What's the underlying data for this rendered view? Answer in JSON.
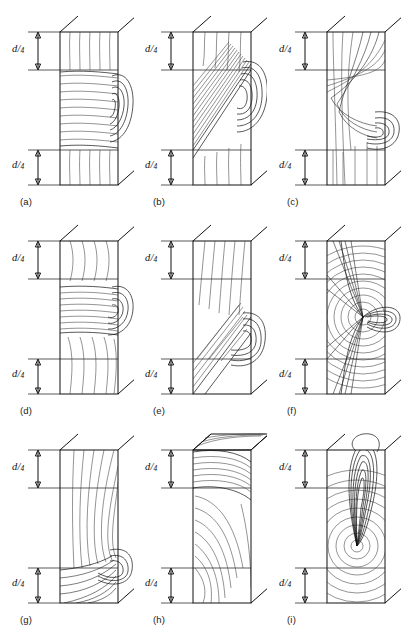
{
  "figure": {
    "type": "technical-line-diagram",
    "background_color": "#ffffff",
    "line_color": "#111111",
    "grain_line_color": "#3a3a3a",
    "rows": 3,
    "columns": 3,
    "dimension_label": {
      "numerator": "d",
      "slash": "/",
      "denominator": "4",
      "full_text": "d/4",
      "meaning": "one quarter of the specimen depth",
      "occurrences_per_panel": 2,
      "positions": [
        "top",
        "bottom"
      ]
    },
    "panels": [
      {
        "id": "a",
        "caption": "(a)",
        "knot": "edge knot, band across mid-depth",
        "knot_position": "right edge, middle",
        "grain": "horizontal band with deflected fibres above and below",
        "top_dim": "d/4",
        "bottom_dim": "d/4"
      },
      {
        "id": "b",
        "caption": "(b)",
        "knot": "edge knot, inclined band",
        "knot_position": "right edge, upper middle",
        "grain": "diagonal band rising left to right",
        "top_dim": "d/4",
        "bottom_dim": "d/4"
      },
      {
        "id": "c",
        "caption": "(c)",
        "knot": "edge knot, low on right face",
        "knot_position": "right edge, lower middle",
        "grain": "sweeping curved fibres converging to knot",
        "top_dim": "d/4",
        "bottom_dim": "d/4"
      },
      {
        "id": "d",
        "caption": "(d)",
        "knot": "edge knot with narrow horizontal band",
        "knot_position": "right edge, middle",
        "grain": "tight horizontal band, curved fibres above and below",
        "top_dim": "d/4",
        "bottom_dim": "d/4"
      },
      {
        "id": "e",
        "caption": "(e)",
        "knot": "edge knot, steep inclined band",
        "knot_position": "right edge, lower middle",
        "grain": "steeply inclined grain crossing lower half",
        "top_dim": "d/4",
        "bottom_dim": "d/4"
      },
      {
        "id": "f",
        "caption": "(f)",
        "knot": "central pith with radiating rays and side knot",
        "knot_position": "centre of face, mid-height",
        "grain": "concentric growth rings about central pith",
        "top_dim": "d/4",
        "bottom_dim": "d/4"
      },
      {
        "id": "g",
        "caption": "(g)",
        "knot": "edge knot near lower quarter",
        "knot_position": "right edge, lower third",
        "grain": "broad curved rings sweeping down to knot",
        "top_dim": "d/4",
        "bottom_dim": "d/4"
      },
      {
        "id": "h",
        "caption": "(h)",
        "knot": "top corner knot wrapping the end",
        "knot_position": "top edge, right corner",
        "grain": "arcs descending from top knot",
        "top_dim": "d/4",
        "bottom_dim": "d/4"
      },
      {
        "id": "i",
        "caption": "(i)",
        "knot": "spike knot rising from centre",
        "knot_position": "centre of face, tapering upward",
        "grain": "concentric rings about a low centre with vertical spike",
        "top_dim": "d/4",
        "bottom_dim": "d/4"
      }
    ]
  }
}
